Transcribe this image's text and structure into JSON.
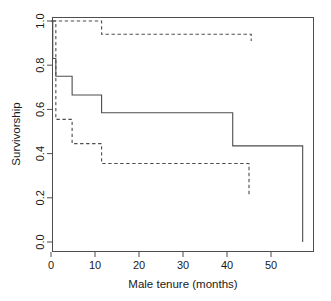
{
  "chart_data": {
    "type": "line",
    "title": "",
    "subtitle": "",
    "xlabel": "Male tenure (months)",
    "ylabel": "Survivorship",
    "xlim": [
      -1.5,
      59
    ],
    "ylim": [
      0.0,
      1.02
    ],
    "xticks": [
      0,
      10,
      20,
      30,
      40,
      50
    ],
    "xtick_labels": [
      "0",
      "10",
      "20",
      "30",
      "40",
      "50"
    ],
    "yticks": [
      0.0,
      0.2,
      0.4,
      0.6,
      0.8,
      1.0
    ],
    "ytick_labels": [
      "0.0",
      "0.2",
      "0.4",
      "0.6",
      "0.8",
      "1.0"
    ],
    "grid": false,
    "legend": null,
    "legend_position": "none",
    "series": [
      {
        "name": "Kaplan-Meier survivorship estimate",
        "style": "solid",
        "color": "#4d4d4d",
        "step": "post",
        "x": [
          0,
          0.4,
          1.1,
          4.8,
          11.5,
          41.3,
          56.8,
          57.2
        ],
        "y": [
          1.0,
          0.83,
          0.75,
          0.665,
          0.585,
          0.435,
          0.435,
          0.0
        ]
      },
      {
        "name": "Upper 95% confidence limit",
        "style": "dashed",
        "color": "#4d4d4d",
        "step": "post",
        "x": [
          0.4,
          1.1,
          11.5,
          41.3,
          45.5
        ],
        "y": [
          1.0,
          1.0,
          0.94,
          0.94,
          0.91
        ]
      },
      {
        "name": "Lower 95% confidence limit",
        "style": "dashed",
        "color": "#4d4d4d",
        "step": "post",
        "x": [
          0.4,
          1.1,
          4.8,
          11.5,
          41.3,
          45.0
        ],
        "y": [
          1.0,
          0.555,
          0.445,
          0.355,
          0.355,
          0.21
        ]
      }
    ]
  },
  "axes": {
    "x_axis_name": "male-tenure-axis",
    "y_axis_name": "survivorship-axis"
  }
}
